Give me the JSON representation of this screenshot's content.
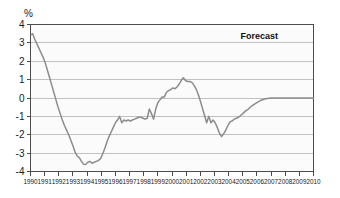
{
  "chart_data": {
    "type": "line",
    "title": "",
    "xlabel": "",
    "ylabel": "%",
    "unit_label": "%",
    "xlim": [
      1990,
      2010
    ],
    "ylim": [
      -4,
      4
    ],
    "grid": true,
    "legend": "none",
    "annotations": [
      {
        "text": "Forecast",
        "x": 2007.5,
        "y": 3.2
      }
    ],
    "y_ticks": [
      4,
      3,
      2,
      1,
      0,
      -1,
      -2,
      -3,
      -4
    ],
    "y_tick_labels": [
      "4",
      "3",
      "2",
      "1",
      "0",
      "-1",
      "-2",
      "-3",
      "-4"
    ],
    "x_ticks": [
      1990,
      1991,
      1992,
      1993,
      1994,
      1995,
      1996,
      1997,
      1998,
      1999,
      2000,
      2001,
      2002,
      2003,
      2004,
      2005,
      2006,
      2007,
      2008,
      2009,
      2010
    ],
    "x_tick_labels": [
      "1990",
      "1991",
      "1992",
      "1993",
      "1994",
      "1995",
      "1996",
      "1997",
      "1998",
      "1999",
      "2000",
      "2001",
      "2002",
      "2003",
      "2004",
      "2005",
      "2006",
      "2007",
      "2008",
      "2009",
      "2010"
    ],
    "series": [
      {
        "name": "output gap",
        "color": "#8c8c8c",
        "x": [
          1990.05,
          1990.15,
          1990.3,
          1990.45,
          1990.6,
          1990.75,
          1990.9,
          1991.05,
          1991.2,
          1991.35,
          1991.5,
          1991.65,
          1991.8,
          1991.95,
          1992.1,
          1992.25,
          1992.4,
          1992.55,
          1992.7,
          1992.85,
          1993.0,
          1993.15,
          1993.3,
          1993.45,
          1993.6,
          1993.75,
          1993.9,
          1994.05,
          1994.2,
          1994.35,
          1994.5,
          1994.65,
          1994.8,
          1994.95,
          1995.1,
          1995.25,
          1995.4,
          1995.55,
          1995.7,
          1995.85,
          1996.0,
          1996.15,
          1996.3,
          1996.45,
          1996.6,
          1996.75,
          1996.9,
          1997.05,
          1997.2,
          1997.35,
          1997.5,
          1997.65,
          1997.8,
          1997.95,
          1998.1,
          1998.25,
          1998.4,
          1998.55,
          1998.7,
          1998.85,
          1999.0,
          1999.15,
          1999.3,
          1999.45,
          1999.6,
          1999.75,
          1999.9,
          2000.05,
          2000.2,
          2000.35,
          2000.5,
          2000.65,
          2000.8,
          2000.95,
          2001.1,
          2001.25,
          2001.4,
          2001.55,
          2001.7,
          2001.85,
          2002.0,
          2002.15,
          2002.3,
          2002.45,
          2002.6,
          2002.75,
          2002.9,
          2003.05,
          2003.2,
          2003.35,
          2003.5,
          2003.65,
          2003.8,
          2003.95,
          2004.1,
          2004.25,
          2004.4,
          2004.55,
          2004.7,
          2004.85,
          2005.0,
          2005.2,
          2005.4,
          2005.6,
          2005.8,
          2006.0,
          2006.3,
          2006.6,
          2007.0,
          2008.0,
          2009.0,
          2010.0
        ],
        "y": [
          3.45,
          3.5,
          3.2,
          2.95,
          2.7,
          2.45,
          2.2,
          1.9,
          1.5,
          1.1,
          0.7,
          0.3,
          -0.1,
          -0.5,
          -0.85,
          -1.2,
          -1.5,
          -1.75,
          -2.0,
          -2.3,
          -2.6,
          -2.95,
          -3.15,
          -3.25,
          -3.45,
          -3.6,
          -3.62,
          -3.5,
          -3.45,
          -3.55,
          -3.5,
          -3.45,
          -3.4,
          -3.3,
          -3.05,
          -2.75,
          -2.4,
          -2.1,
          -1.85,
          -1.6,
          -1.35,
          -1.2,
          -1.0,
          -1.35,
          -1.2,
          -1.25,
          -1.2,
          -1.25,
          -1.2,
          -1.15,
          -1.1,
          -1.05,
          -1.05,
          -1.1,
          -1.15,
          -1.1,
          -0.6,
          -0.85,
          -1.15,
          -0.6,
          -0.25,
          -0.1,
          0.05,
          0.05,
          0.3,
          0.4,
          0.45,
          0.55,
          0.5,
          0.6,
          0.75,
          0.95,
          1.1,
          0.95,
          0.9,
          0.9,
          0.85,
          0.7,
          0.5,
          0.2,
          -0.15,
          -0.55,
          -0.95,
          -1.35,
          -1.0,
          -1.35,
          -1.2,
          -1.35,
          -1.6,
          -1.9,
          -2.1,
          -1.95,
          -1.75,
          -1.5,
          -1.3,
          -1.25,
          -1.15,
          -1.1,
          -1.05,
          -0.95,
          -0.85,
          -0.7,
          -0.6,
          -0.45,
          -0.35,
          -0.25,
          -0.12,
          -0.04,
          0.0,
          0.0,
          0.0,
          0.0
        ]
      }
    ]
  }
}
